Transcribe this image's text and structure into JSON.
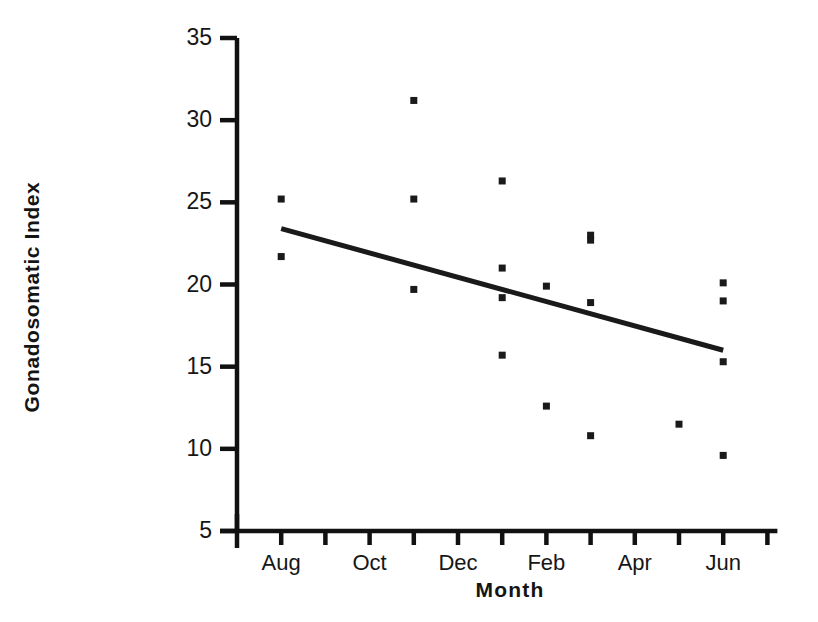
{
  "chart_data": {
    "type": "scatter",
    "title": "",
    "xlabel": "Month",
    "ylabel": "Gonadosomatic Index",
    "grid": false,
    "legend": "none",
    "ylim": [
      5,
      35
    ],
    "yticks": [
      5,
      10,
      15,
      20,
      25,
      30,
      35
    ],
    "ytick_labels": [
      "5",
      "10",
      "15",
      "20",
      "25",
      "30",
      "35"
    ],
    "xlim": [
      "Jul",
      "Jul"
    ],
    "x_categories": [
      "Jul",
      "Aug",
      "Sep",
      "Oct",
      "Nov",
      "Dec",
      "Jan",
      "Feb",
      "Mar",
      "Apr",
      "May",
      "Jun",
      "Jul"
    ],
    "xticks_labeled": [
      "Aug",
      "Oct",
      "Dec",
      "Feb",
      "Apr",
      "Jun"
    ],
    "xtick_label_months": [
      1,
      3,
      5,
      7,
      9,
      11
    ],
    "points": [
      {
        "month": "Aug",
        "month_index": 1,
        "y": 25.2
      },
      {
        "month": "Aug",
        "month_index": 1,
        "y": 21.7
      },
      {
        "month": "Nov",
        "month_index": 4,
        "y": 31.2
      },
      {
        "month": "Nov",
        "month_index": 4,
        "y": 25.2
      },
      {
        "month": "Nov",
        "month_index": 4,
        "y": 19.7
      },
      {
        "month": "Jan",
        "month_index": 6,
        "y": 26.3
      },
      {
        "month": "Jan",
        "month_index": 6,
        "y": 21.0
      },
      {
        "month": "Jan",
        "month_index": 6,
        "y": 19.2
      },
      {
        "month": "Jan",
        "month_index": 6,
        "y": 15.7
      },
      {
        "month": "Feb",
        "month_index": 7,
        "y": 19.9
      },
      {
        "month": "Feb",
        "month_index": 7,
        "y": 12.6
      },
      {
        "month": "Mar",
        "month_index": 8,
        "y": 23.0
      },
      {
        "month": "Mar",
        "month_index": 8,
        "y": 22.7
      },
      {
        "month": "Mar",
        "month_index": 8,
        "y": 18.9
      },
      {
        "month": "Mar",
        "month_index": 8,
        "y": 10.8
      },
      {
        "month": "May",
        "month_index": 10,
        "y": 11.5
      },
      {
        "month": "Jun",
        "month_index": 11,
        "y": 20.1
      },
      {
        "month": "Jun",
        "month_index": 11,
        "y": 19.0
      },
      {
        "month": "Jun",
        "month_index": 11,
        "y": 15.3
      },
      {
        "month": "Jun",
        "month_index": 11,
        "y": 9.6
      }
    ],
    "trendline": {
      "x_start_month_index": 1,
      "y_start": 23.4,
      "x_end_month_index": 11,
      "y_end": 16.0
    },
    "marker": {
      "shape": "square",
      "size_px": 7,
      "color": "#1a1a1a"
    },
    "line_color": "#1a1a1a",
    "axis_color": "#111111"
  }
}
